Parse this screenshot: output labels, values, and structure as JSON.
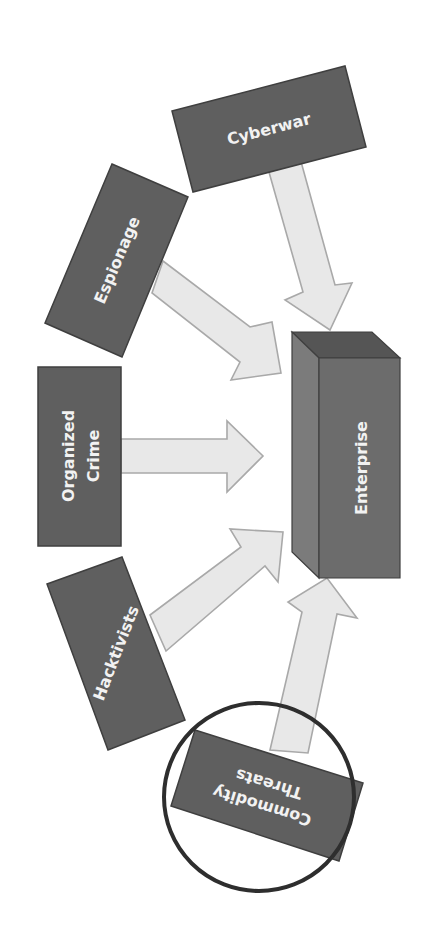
{
  "diagram": {
    "target": {
      "label": "Enterprise"
    },
    "sources": [
      {
        "id": "cyberwar",
        "label": "Cyberwar"
      },
      {
        "id": "espionage",
        "label": "Espionage"
      },
      {
        "id": "organized-crime",
        "label_line1": "Organized",
        "label_line2": "Crime"
      },
      {
        "id": "hacktivists",
        "label": "Hacktivists"
      },
      {
        "id": "commodity-threats",
        "label_line1": "Commodity",
        "label_line2": "Threats",
        "highlighted": true
      }
    ],
    "edges": [
      {
        "from": "cyberwar",
        "to": "enterprise"
      },
      {
        "from": "espionage",
        "to": "enterprise"
      },
      {
        "from": "organized-crime",
        "to": "enterprise"
      },
      {
        "from": "hacktivists",
        "to": "enterprise"
      },
      {
        "from": "commodity-threats",
        "to": "enterprise"
      }
    ],
    "colors": {
      "box_fill": "#5f5f5f",
      "arrow_fill": "#e8e8e8",
      "highlight_ring": "#2e2e2e"
    }
  }
}
